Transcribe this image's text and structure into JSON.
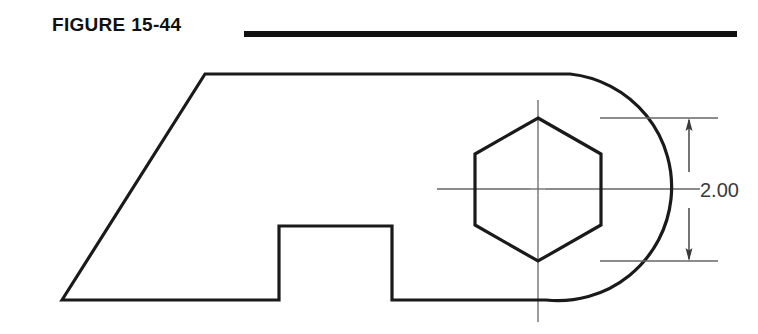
{
  "figure": {
    "title": "FIGURE 15-44",
    "rule": {
      "x1": 244,
      "x2": 737,
      "y": 34,
      "thickness": 6,
      "color": "#111111"
    }
  },
  "drawing": {
    "type": "engineering-part-orthographic-view",
    "line_color": "#1a1a1a",
    "centerline_color": "#666666",
    "dimension_color": "#3a3a3a",
    "object_line_width": 3.2,
    "thin_line_width": 1.3,
    "outline_points": "62,300 205,74 570,74",
    "outline_path_note": "left diagonal rises from bottom-left corner to top-left corner, top edge runs right to arc tangent",
    "baseline": {
      "y": 300,
      "x_start": 62,
      "x_end": 546
    },
    "top_edge": {
      "y": 74,
      "x_start": 205,
      "x_end": 570
    },
    "arc": {
      "center_x": 538,
      "center_y": 187,
      "radius": 113,
      "start": "570,74",
      "end": "546,300",
      "note": "large right-hand radius blending top edge to bottom edge"
    },
    "notch": {
      "x_left": 279,
      "x_right": 392,
      "y_top": 226,
      "y_bottom": 300,
      "note": "rectangular raised step on bottom edge"
    },
    "hexagon": {
      "center_x": 538,
      "center_y": 189,
      "circumradius": 72,
      "orientation": "pointy-top",
      "vertices": "538,118 601,154 601,225 538,261 475,225 475,154"
    },
    "centerlines": {
      "horizontal": {
        "y": 189,
        "x_start": 437,
        "x_end": 700
      },
      "vertical": {
        "x": 538,
        "y_start": 100,
        "y_end": 322
      },
      "center_mark_size": 13
    }
  },
  "dimension": {
    "label": "2.00",
    "value": 2.0,
    "units": "inches",
    "measures": "hexagon across-corners height",
    "extension_lines": [
      {
        "y": 118,
        "x_start": 600,
        "x_end": 718
      },
      {
        "y": 261,
        "x_start": 600,
        "x_end": 718
      }
    ],
    "dimension_line": {
      "x": 689,
      "y_top": 118,
      "y_bottom": 261,
      "arrow_length": 13,
      "arrow_half_width": 3.5
    },
    "text_position": {
      "x": 700,
      "y": 190
    }
  }
}
